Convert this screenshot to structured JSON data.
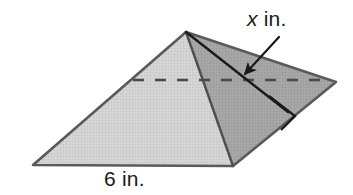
{
  "figure": {
    "kind": "geometry-diagram",
    "labels": {
      "slant_height_variable": "x",
      "slant_height_unit": "in.",
      "slant_height_full": "x in.",
      "base_edge_full": "6 in.",
      "base_edge_value": "6",
      "base_edge_unit": "in."
    },
    "colors": {
      "background": "#ffffff",
      "left_front_face": "#d6d6d6",
      "right_front_face": "#a9a9a9",
      "right_back_face": "#9e9e9e",
      "far_back_face": "#b5b5b5",
      "outline": "#555555",
      "solid_line": "#1a1a1a",
      "dashed_line": "#4a4a4a",
      "text": "#1a1a1a"
    },
    "annotations": {
      "right_angle_marker": "right-angle-square",
      "hidden_edge_style": "dashed",
      "leader_line": "arrow pointing from x in. label to the slant height segment"
    },
    "geometry": {
      "apex": [
        186,
        32
      ],
      "base_left": [
        33,
        165
      ],
      "base_front": [
        233,
        166
      ],
      "base_right": [
        336,
        82
      ],
      "base_back_hidden": [
        133,
        80
      ],
      "slant_foot": [
        288,
        112
      ],
      "arrow_tail": [
        278,
        38
      ],
      "arrow_tip": [
        241,
        78
      ]
    }
  }
}
